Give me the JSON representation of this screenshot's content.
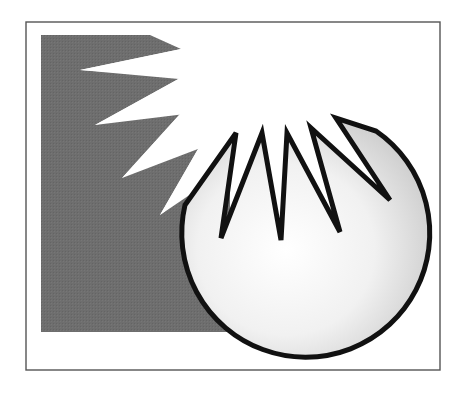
{
  "illustration": {
    "title": "Starburst and sphere",
    "description": "Gray square with white starburst spikes radiating from upper right, partially covered by a white shaded sphere whose top edge is a jagged zigzag",
    "colors": {
      "background": "#ffffff",
      "frame": "#555555",
      "gray_panel": "#6f6f6f",
      "burst": "#ffffff",
      "sphere_light": "#ffffff",
      "sphere_shadow": "#cfcfcf",
      "outline": "#111111"
    }
  }
}
